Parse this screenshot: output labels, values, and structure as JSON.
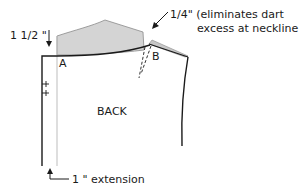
{
  "diagram": {
    "labels": {
      "yoke_height": "1 1/2 \"",
      "point_a": "A",
      "point_b": "B",
      "note_line1": "1/4\" (eliminates dart",
      "note_line2": "excess at neckline",
      "piece_name": "BACK",
      "extension": "1 \" extension"
    },
    "colors": {
      "line": "#1a1a1a",
      "yoke_fill": "#d4d4d4",
      "guide_line": "#bdbdbd",
      "shoulder_wedge": "#c8c8c8"
    }
  }
}
